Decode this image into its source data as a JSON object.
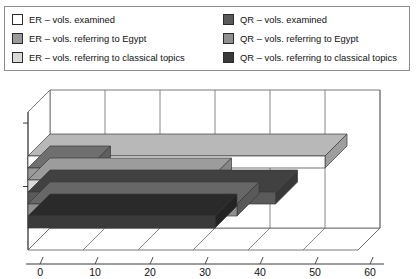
{
  "legend": {
    "items": [
      {
        "label": "ER – vols. examined",
        "color": "#ffffff",
        "key": "er_examined"
      },
      {
        "label": "QR – vols. examined",
        "color": "#5a5a5a",
        "key": "qr_examined"
      },
      {
        "label": "ER – vols. referring to Egypt",
        "color": "#9a9a9a",
        "key": "er_egypt"
      },
      {
        "label": "QR – vols. referring to Egypt",
        "color": "#8f8f8f",
        "key": "qr_egypt"
      },
      {
        "label": "ER – vols. referring to classical topics",
        "color": "#d9d9d9",
        "key": "er_classical"
      },
      {
        "label": "QR – vols. referring to classical topics",
        "color": "#3a3a3a",
        "key": "qr_classical"
      }
    ]
  },
  "chart_data": {
    "type": "bar",
    "orientation": "horizontal",
    "three_d": true,
    "title": "",
    "xlabel": "",
    "ylabel": "",
    "xlim": [
      0,
      60
    ],
    "xticks": [
      0,
      10,
      20,
      30,
      40,
      50,
      60
    ],
    "xtick_labels": [
      "0",
      "10",
      "20",
      "30",
      "40",
      "50",
      "60"
    ],
    "grid": true,
    "legend_position": "top",
    "categories": [
      "ER – vols. examined",
      "ER – vols. referring to Egypt",
      "ER – vols. referring to classical topics",
      "QR – vols. examined",
      "QR – vols. referring to Egypt",
      "QR – vols. referring to classical topics"
    ],
    "values": [
      54,
      11,
      33,
      45,
      38,
      34
    ],
    "colors": [
      "#ffffff",
      "#9a9a9a",
      "#d9d9d9",
      "#5a5a5a",
      "#8f8f8f",
      "#3a3a3a"
    ]
  }
}
